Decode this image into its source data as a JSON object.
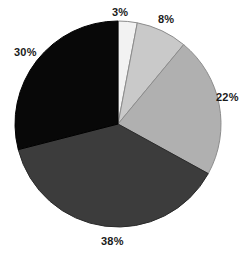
{
  "chart_data": {
    "type": "pie",
    "title": "",
    "subtitle": "",
    "xlabel": "",
    "ylabel": "",
    "legend_position": "none",
    "grid": false,
    "labels_shown": "percent",
    "start_angle_deg": 0,
    "direction": "clockwise",
    "center": {
      "x": 118,
      "y": 124
    },
    "radius": 103,
    "categories": [
      "3%",
      "8%",
      "22%",
      "38%",
      "30%"
    ],
    "values": [
      3,
      8,
      22,
      38,
      30
    ],
    "total": 101,
    "slices": [
      {
        "label": "3%",
        "value": 3,
        "color": "#f2f2f2",
        "stroke": "#8c8c8c",
        "start_deg": 0,
        "end_deg": 10.8,
        "label_position": "top"
      },
      {
        "label": "8%",
        "value": 8,
        "color": "#c9c9c9",
        "stroke": "#8c8c8c",
        "start_deg": 10.8,
        "end_deg": 39.6,
        "label_position": "top-right"
      },
      {
        "label": "22%",
        "value": 22,
        "color": "#b0b0b0",
        "stroke": "#8c8c8c",
        "start_deg": 39.6,
        "end_deg": 118.8,
        "label_position": "right"
      },
      {
        "label": "38%",
        "value": 38,
        "color": "#3c3c3c",
        "stroke": "#2a2a2a",
        "start_deg": 118.8,
        "end_deg": 255.6,
        "label_position": "bottom"
      },
      {
        "label": "30%",
        "value": 30,
        "color": "#080808",
        "stroke": "#000000",
        "start_deg": 255.6,
        "end_deg": 360,
        "label_position": "left"
      }
    ],
    "background_color": "#ffffff",
    "label_color": "#1a1a1a"
  }
}
